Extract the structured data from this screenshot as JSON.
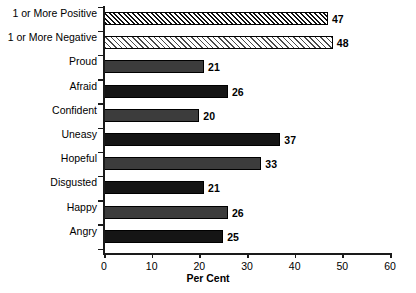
{
  "chart_data": {
    "type": "bar",
    "orientation": "horizontal",
    "title": "",
    "xlabel": "Per Cent",
    "ylabel": "",
    "xlim": [
      0,
      60
    ],
    "xticks": [
      0,
      10,
      20,
      30,
      40,
      50,
      60
    ],
    "grid": false,
    "legend": null,
    "categories": [
      "1 or More Positive",
      "1 or More Negative",
      "Proud",
      "Afraid",
      "Confident",
      "Uneasy",
      "Hopeful",
      "Disgusted",
      "Happy",
      "Angry"
    ],
    "values": [
      47,
      48,
      21,
      26,
      20,
      37,
      33,
      21,
      26,
      25
    ],
    "data_labels": [
      "47",
      "48",
      "21",
      "26",
      "20",
      "37",
      "33",
      "21",
      "26",
      "25"
    ],
    "bar_styles": [
      "hatch-dense",
      "hatch-light",
      "mid-gray",
      "black",
      "mid-gray",
      "black",
      "mid-gray",
      "black",
      "mid-gray",
      "black"
    ],
    "colors": {
      "bar_dark": "#151515",
      "bar_mid": "#3c3c3c",
      "hatch_line": "#101010",
      "hatch_light_line": "#4a4a4a",
      "axis": "#1a1a1a",
      "text": "#000000",
      "background": "#ffffff"
    }
  }
}
